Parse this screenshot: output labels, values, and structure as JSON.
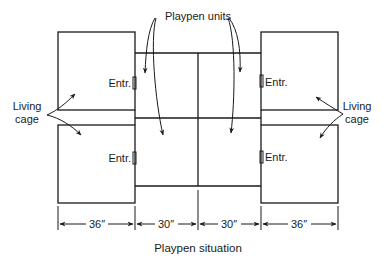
{
  "diagram": {
    "title": "Playpen situation",
    "callouts": {
      "playpen_units": "Playpen units",
      "living_cage_left_line1": "Living",
      "living_cage_left_line2": "cage",
      "living_cage_right_line1": "Living",
      "living_cage_right_line2": "cage"
    },
    "entrances": {
      "top_left": "Entr.",
      "bottom_left": "Entr.",
      "top_right": "Entr.",
      "bottom_right": "Entr."
    },
    "dimensions": [
      {
        "label": "36″",
        "segment": "left living cage"
      },
      {
        "label": "30″",
        "segment": "left playpen unit"
      },
      {
        "label": "30″",
        "segment": "right playpen unit"
      },
      {
        "label": "36″",
        "segment": "right living cage"
      }
    ],
    "components": [
      {
        "name": "Living cage",
        "position": "top-left"
      },
      {
        "name": "Living cage",
        "position": "bottom-left"
      },
      {
        "name": "Playpen unit",
        "position": "top-center-left"
      },
      {
        "name": "Playpen unit",
        "position": "top-center-right"
      },
      {
        "name": "Playpen unit",
        "position": "bottom-center-left"
      },
      {
        "name": "Playpen unit",
        "position": "bottom-center-right"
      },
      {
        "name": "Living cage",
        "position": "top-right"
      },
      {
        "name": "Living cage",
        "position": "bottom-right"
      }
    ],
    "colors": {
      "ink": "#1a1a1a",
      "background": "#ffffff"
    }
  }
}
